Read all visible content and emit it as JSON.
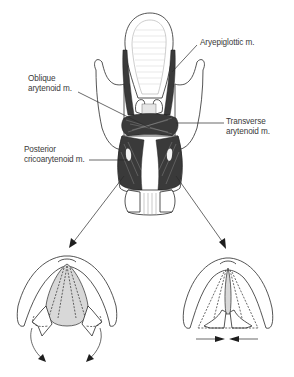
{
  "figure": {
    "labels": {
      "aryepiglottic": "Aryepiglottic m.",
      "oblique_line1": "Oblique",
      "oblique_line2": "arytenoid m.",
      "transverse_line1": "Transverse",
      "transverse_line2": "arytenoid m.",
      "posterior_line1": "Posterior",
      "posterior_line2": "cricoarytenoid m."
    },
    "insets": [
      {
        "name": "abduction",
        "description": "Vocal folds abducted; glottis opened wide, curved arrows pointing outward"
      },
      {
        "name": "adduction",
        "description": "Vocal folds adducted; glottis narrowed, horizontal arrows pointing inward"
      }
    ],
    "colors": {
      "line": "#2a2a2a",
      "muscle": "#3a3a3a",
      "glottis_fill": "#d8d8d8",
      "background": "#ffffff"
    }
  }
}
